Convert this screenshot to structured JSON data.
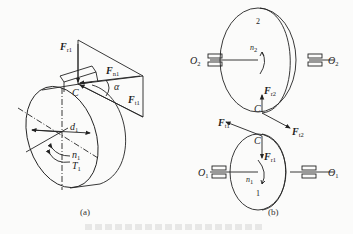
{
  "figure_a": {
    "caption": "(a)",
    "labels": {
      "Fr1": {
        "main": "F",
        "sub": "r1"
      },
      "Fn1": {
        "main": "F",
        "sub": "n1"
      },
      "Ft1": {
        "main": "F",
        "sub": "t1"
      },
      "alpha": "α",
      "C": "C",
      "d1": {
        "main": "d",
        "sub": "1"
      },
      "n1": {
        "main": "n",
        "sub": "1"
      },
      "T1": {
        "main": "T",
        "sub": "1"
      }
    }
  },
  "figure_b": {
    "caption": "(b)",
    "labels": {
      "gear2": "2",
      "gear1": "1",
      "O2_left": {
        "main": "O",
        "sub": "2"
      },
      "O2_right": {
        "main": "O",
        "sub": "2"
      },
      "O1_left": {
        "main": "O",
        "sub": "1"
      },
      "O1_right": {
        "main": "O",
        "sub": "1"
      },
      "n2": {
        "main": "n",
        "sub": "2"
      },
      "n1": {
        "main": "n",
        "sub": "1"
      },
      "Fr2": {
        "main": "F",
        "sub": "r2"
      },
      "Ft2": {
        "main": "F",
        "sub": "t2"
      },
      "Ft1": {
        "main": "F",
        "sub": "t1"
      },
      "Fr1": {
        "main": "F",
        "sub": "r1"
      },
      "C_top": "C",
      "C_bottom": "C"
    }
  },
  "colors": {
    "ink": "#222222",
    "background": "#fbfbfa"
  }
}
